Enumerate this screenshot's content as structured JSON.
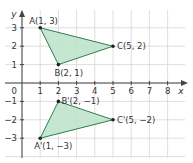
{
  "chart_data": {
    "type": "scatter",
    "title": "",
    "xlabel": "x",
    "ylabel": "y",
    "xlim": [
      0,
      8
    ],
    "ylim": [
      -3,
      3
    ],
    "grid": true,
    "x_ticks": [
      "1",
      "2",
      "3",
      "4",
      "5",
      "6",
      "7",
      "8"
    ],
    "y_ticks": [
      "3",
      "2",
      "1",
      "-1",
      "-2",
      "-3"
    ],
    "origin_label": "0",
    "fill_color": "#bfe3cc",
    "edge_color": "#2e7d4f",
    "shapes": [
      {
        "name": "triangle-ABC",
        "points": [
          {
            "label": "A(1, 3)",
            "x": 1,
            "y": 3
          },
          {
            "label": "B(2, 1)",
            "x": 2,
            "y": 1
          },
          {
            "label": "C(5, 2)",
            "x": 5,
            "y": 2
          }
        ]
      },
      {
        "name": "triangle-A'B'C'",
        "points": [
          {
            "label": "A'(1, −3)",
            "x": 1,
            "y": -3
          },
          {
            "label": "B'(2, −1)",
            "x": 2,
            "y": -1
          },
          {
            "label": "C'(5, −2)",
            "x": 5,
            "y": -2
          }
        ]
      }
    ]
  }
}
